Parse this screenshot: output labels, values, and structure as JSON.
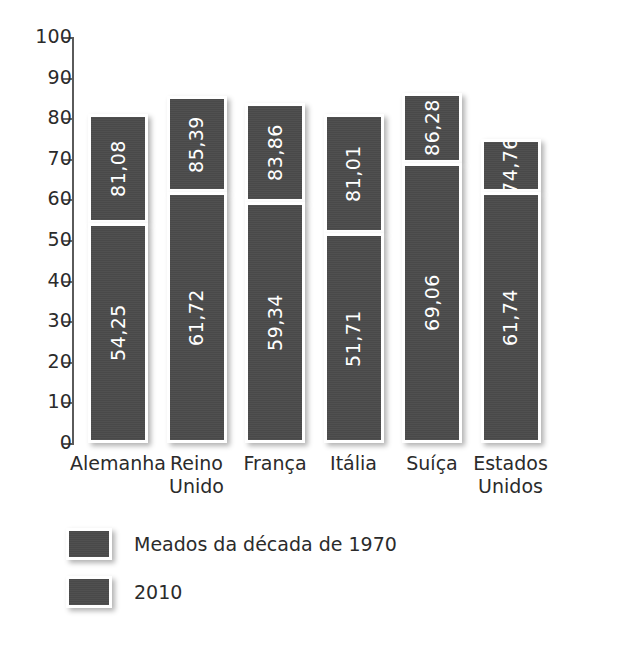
{
  "chart_data": {
    "type": "bar",
    "title": "",
    "subtitle": "",
    "xlabel": "",
    "ylabel": "",
    "ylim": [
      0,
      100
    ],
    "ytick_labels": [
      "100",
      "90",
      "80",
      "70",
      "60",
      "50",
      "40",
      "30",
      "20",
      "10",
      "0"
    ],
    "ytick_values": [
      100,
      90,
      80,
      70,
      60,
      50,
      40,
      30,
      20,
      10,
      0
    ],
    "grid": false,
    "legend_position": "bottom-left",
    "categories": [
      "Alemanha",
      "Reino Unido",
      "França",
      "Itália",
      "Suíça",
      "Estados Unidos"
    ],
    "series": [
      {
        "name": "Meados da década de 1970",
        "values": [
          54.25,
          61.72,
          59.34,
          51.71,
          69.06,
          61.74
        ],
        "value_labels": [
          "54,25",
          "61,72",
          "59,34",
          "51,71",
          "69,06",
          "61,74"
        ]
      },
      {
        "name": "2010",
        "values": [
          81.08,
          85.39,
          83.86,
          81.01,
          86.28,
          74.76
        ],
        "value_labels": [
          "81,08",
          "85,39",
          "83,86",
          "81,01",
          "86,28",
          "74,76"
        ]
      }
    ],
    "bar_color": "#4a4a4a",
    "label_color": "#ffffff",
    "background": "#ffffff"
  },
  "axis": {
    "ticks": [
      {
        "label": "100",
        "value": 100
      },
      {
        "label": "90",
        "value": 90
      },
      {
        "label": "80",
        "value": 80
      },
      {
        "label": "70",
        "value": 70
      },
      {
        "label": "60",
        "value": 60
      },
      {
        "label": "50",
        "value": 50
      },
      {
        "label": "40",
        "value": 40
      },
      {
        "label": "30",
        "value": 30
      },
      {
        "label": "20",
        "value": 20
      },
      {
        "label": "10",
        "value": 10
      },
      {
        "label": "0",
        "value": 0
      }
    ]
  },
  "bars": [
    {
      "category": "Alemanha",
      "category_lines": [
        "Alemanha"
      ],
      "top_label": "81,08",
      "top_value": 81.08,
      "bottom_label": "54,25",
      "bottom_value": 54.25
    },
    {
      "category": "Reino Unido",
      "category_lines": [
        "Reino",
        "Unido"
      ],
      "top_label": "85,39",
      "top_value": 85.39,
      "bottom_label": "61,72",
      "bottom_value": 61.72
    },
    {
      "category": "França",
      "category_lines": [
        "França"
      ],
      "top_label": "83,86",
      "top_value": 83.86,
      "bottom_label": "59,34",
      "bottom_value": 59.34
    },
    {
      "category": "Itália",
      "category_lines": [
        "Itália"
      ],
      "top_label": "81,01",
      "top_value": 81.01,
      "bottom_label": "51,71",
      "bottom_value": 51.71
    },
    {
      "category": "Suíça",
      "category_lines": [
        "Suíça"
      ],
      "top_label": "86,28",
      "top_value": 86.28,
      "bottom_label": "69,06",
      "bottom_value": 69.06
    },
    {
      "category": "Estados Unidos",
      "category_lines": [
        "Estados",
        "Unidos"
      ],
      "top_label": "74,76",
      "top_value": 74.76,
      "bottom_label": "61,74",
      "bottom_value": 61.74
    }
  ],
  "legend": {
    "items": [
      {
        "label": "Meados da década de 1970"
      },
      {
        "label": "2010"
      }
    ]
  }
}
